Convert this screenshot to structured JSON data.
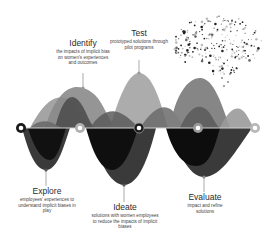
{
  "diagram": {
    "type": "design-thinking-wave",
    "stages": [
      {
        "id": "explore",
        "title": "Explore",
        "description": "employees' experiences to understand implicit biases in play",
        "position": "below"
      },
      {
        "id": "identify",
        "title": "Identify",
        "description": "the impacts of implicit bias on women's experiences and outcomes",
        "position": "above"
      },
      {
        "id": "ideate",
        "title": "Ideate",
        "description": "solutions with women employees to reduce the impacts of implicit biases",
        "position": "below"
      },
      {
        "id": "test",
        "title": "Test",
        "description": "prototyped solutions through pilot programs",
        "position": "above"
      },
      {
        "id": "evaluate",
        "title": "Evaluate",
        "description": "impact and refine solutions",
        "position": "below"
      }
    ],
    "colors": {
      "dark": "#1a1a1a",
      "mid_dark": "#3a3a3a",
      "mid": "#6b6b6b",
      "light": "#9a9a9a",
      "lighter": "#b8b8b8",
      "baseline": "#cfcfcf"
    },
    "decoration": "brain-dot-cloud-icon"
  }
}
